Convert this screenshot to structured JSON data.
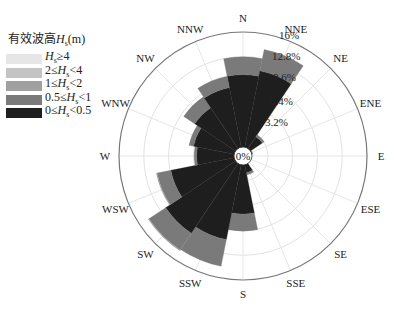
{
  "chart_data": {
    "type": "wind_rose",
    "title": "",
    "legend": {
      "title": "有效波高H_s(m)",
      "entries": [
        {
          "label": "H_s≥4",
          "color": "#e6e6e6"
        },
        {
          "label": "2≤H_s<4",
          "color": "#c4c4c4"
        },
        {
          "label": "1≤H_s<2",
          "color": "#a0a0a0"
        },
        {
          "label": "0.5≤H_s<1",
          "color": "#7a7a7a"
        },
        {
          "label": "0≤H_s<0.5",
          "color": "#1e1e1e"
        }
      ],
      "position": "upper-left"
    },
    "directions": [
      "N",
      "NNE",
      "NE",
      "ENE",
      "E",
      "ESE",
      "SE",
      "SSE",
      "S",
      "SSW",
      "SW",
      "WSW",
      "W",
      "WNW",
      "NW",
      "NNW"
    ],
    "radial_ticks": [
      "0%",
      "3.2%",
      "6.4%",
      "9.6%",
      "12.8%",
      "16%"
    ],
    "rmax": 16,
    "series": [
      {
        "name": "0≤H_s<0.5",
        "values": [
          10.5,
          11.2,
          3.0,
          1.2,
          0.8,
          0.8,
          1.0,
          2.2,
          7.5,
          11.0,
          12.0,
          9.5,
          6.0,
          6.5,
          7.5,
          9.0
        ]
      },
      {
        "name": "0.5≤H_s<1",
        "values": [
          2.3,
          2.8,
          0.3,
          0.1,
          0.1,
          0.1,
          0.1,
          0.3,
          2.2,
          3.5,
          2.6,
          1.8,
          0.3,
          0.6,
          1.7,
          1.5
        ]
      },
      {
        "name": "1≤H_s<2",
        "values": [
          0,
          0,
          0,
          0,
          0,
          0,
          0,
          0,
          0,
          0,
          0.1,
          0.1,
          0,
          0,
          0,
          0
        ]
      },
      {
        "name": "2≤H_s<4",
        "values": [
          0,
          0,
          0,
          0,
          0,
          0,
          0,
          0,
          0,
          0,
          0,
          0,
          0,
          0,
          0,
          0
        ]
      },
      {
        "name": "H_s≥4",
        "values": [
          0,
          0,
          0,
          0,
          0,
          0,
          0,
          0,
          0,
          0,
          0,
          0,
          0,
          0,
          0,
          0
        ]
      }
    ],
    "grid": true
  },
  "legend_display": {
    "title_prefix": "有效波高",
    "title_var": "H",
    "title_sub": "s",
    "title_suffix": "(m)",
    "rows": [
      {
        "pre": "",
        "var": "H",
        "sub": "s",
        "post": "≥4"
      },
      {
        "pre": "2≤",
        "var": "H",
        "sub": "s",
        "post": "<4"
      },
      {
        "pre": "1≤",
        "var": "H",
        "sub": "s",
        "post": "<2"
      },
      {
        "pre": "0.5≤",
        "var": "H",
        "sub": "s",
        "post": "<1"
      },
      {
        "pre": "0≤",
        "var": "H",
        "sub": "s",
        "post": "<0.5"
      }
    ]
  }
}
